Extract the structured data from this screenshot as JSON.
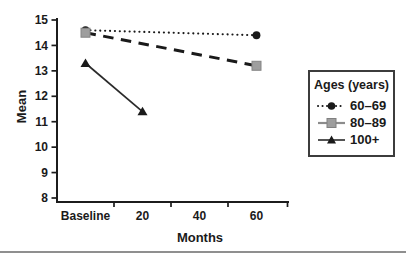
{
  "chart_data": {
    "type": "line",
    "title": "",
    "xlabel": "Months",
    "ylabel": "Mean",
    "categories": [
      "Baseline",
      "20",
      "40",
      "60"
    ],
    "yticks": [
      8,
      9,
      10,
      11,
      12,
      13,
      14,
      15
    ],
    "ylim": [
      8,
      15
    ],
    "grid": false,
    "legend": {
      "title": "Ages (years)",
      "position": "right"
    },
    "series": [
      {
        "name": "60–69",
        "line_style": "dotted",
        "marker": "circle",
        "color": "#1a1a1a",
        "marker_color": "#1a1a1a",
        "points": [
          {
            "x": "Baseline",
            "y": 14.6
          },
          {
            "x": "60",
            "y": 14.4
          }
        ]
      },
      {
        "name": "80–89",
        "line_style": "dashed",
        "marker": "square",
        "color": "#1a1a1a",
        "marker_color": "#9e9e9e",
        "points": [
          {
            "x": "Baseline",
            "y": 14.5
          },
          {
            "x": "60",
            "y": 13.2
          }
        ]
      },
      {
        "name": "100+",
        "line_style": "solid",
        "marker": "triangle",
        "color": "#2a2a2a",
        "marker_color": "#1a1a1a",
        "points": [
          {
            "x": "Baseline",
            "y": 13.3
          },
          {
            "x": "20",
            "y": 11.4
          }
        ]
      }
    ],
    "colors": {
      "axis": "#1c1c1c",
      "tick_text": "#1a1a1a",
      "gray_marker": "#9e9e9e",
      "legend_gray_line": "#8c8c8c",
      "bottom_rule": "#8f8f8f"
    }
  }
}
